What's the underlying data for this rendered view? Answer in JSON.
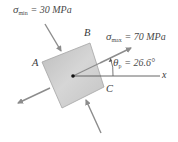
{
  "diagram": {
    "type": "stress-element-principal",
    "element": {
      "fill": "#c8c8c8",
      "stroke": "#9a9a9a"
    },
    "points": {
      "A": "A",
      "B": "B",
      "C": "C"
    },
    "sigma_min": {
      "symbol": "σ",
      "subscript": "min",
      "equals": "= 30 MPa"
    },
    "sigma_max": {
      "symbol": "σ",
      "subscript": "max",
      "equals": "= 70 MPa"
    },
    "theta": {
      "symbol": "θ",
      "subscript": "p",
      "equals": "= 26.6°"
    },
    "axis_label": "x",
    "arrow_color": "#8c8c8c",
    "line_color": "#555555"
  }
}
